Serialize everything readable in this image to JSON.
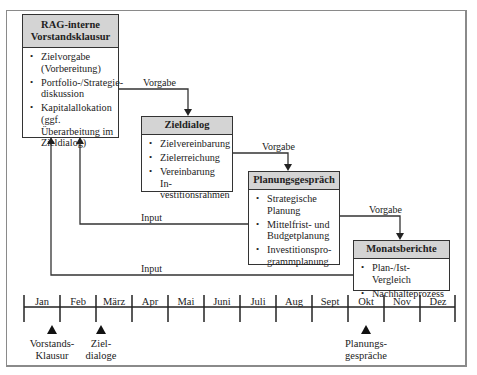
{
  "boxes": {
    "vorstandsklausur": {
      "title_line1": "RAG-interne",
      "title_line2": "Vorstandsklausur",
      "items": [
        "Zielvorgabe (Vorbereitung)",
        "Portfolio-/Strategie-diskussion",
        "Kapitalallokation (ggf. Überarbeitung im Zieldialog)"
      ]
    },
    "zieldialog": {
      "title": "Zieldialog",
      "items": [
        "Zielvereinbarung",
        "Zielerreichung",
        "Vereinbarung In-vestitionsrahmen"
      ]
    },
    "planungsgespraech": {
      "title": "Planungsgespräch",
      "items": [
        "Strategische Planung",
        "Mittelfrist- und Budgetplanung",
        "Investitionspro-grammplanung"
      ]
    },
    "monatsberichte": {
      "title": "Monatsberichte",
      "items": [
        "Plan-/Ist-Vergleich",
        "Nachhalteprozess"
      ]
    }
  },
  "connectors": {
    "vorgabe_1": "Vorgabe",
    "vorgabe_2": "Vorgabe",
    "vorgabe_3": "Vorgabe",
    "input_1": "Input",
    "input_2": "Input"
  },
  "timeline": {
    "months": [
      "Jan",
      "Feb",
      "März",
      "Apr",
      "Mai",
      "Juni",
      "Juli",
      "Aug",
      "Sept",
      "Okt",
      "Nov",
      "Dez"
    ],
    "markers": [
      {
        "month": "Jan",
        "label_line1": "Vorstands-",
        "label_line2": "Klausur"
      },
      {
        "month": "März",
        "label_line1": "Ziel-",
        "label_line2": "dialoge"
      },
      {
        "month": "Okt",
        "label_line1": "Planungs-",
        "label_line2": "gespräche"
      }
    ]
  },
  "colors": {
    "header_fill": "#d4d4d4",
    "line": "#333333",
    "frame": "#8a8a8a"
  }
}
